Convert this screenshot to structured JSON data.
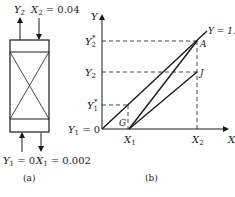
{
  "panel_a": {
    "top_left_label": "Y",
    "top_left_sub": "2",
    "top_right_label": "X",
    "top_right_sub": "2",
    "top_right_value": " = 0.04",
    "bottom_left_label": "Y",
    "bottom_left_sub": "1",
    "bottom_left_value": " = 0",
    "bottom_right_label": "X",
    "bottom_right_sub": "1",
    "bottom_right_value": " = 0.002",
    "caption": "(a)"
  },
  "panel_b": {
    "y_axis_label": "Y",
    "x_axis_label": "X",
    "y_ticks": [
      {
        "main": "Y",
        "sub": "2",
        "sup": "*"
      },
      {
        "main": "Y",
        "sub": "2",
        "sup": ""
      },
      {
        "main": "Y",
        "sub": "1",
        "sup": "*"
      },
      {
        "main": "Y",
        "sub": "1",
        "sup": "",
        "suffix": " = 0"
      }
    ],
    "x_ticks": [
      {
        "main": "X",
        "sub": "1"
      },
      {
        "main": "X",
        "sub": "2"
      }
    ],
    "line_label": "Y = 1.3",
    "points": {
      "A": "A",
      "J": "J",
      "G": "G"
    },
    "caption": "(b)"
  },
  "colors": {
    "line": "#1a1a1a",
    "background": "#ffffff"
  }
}
